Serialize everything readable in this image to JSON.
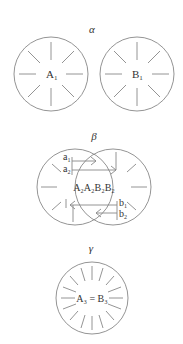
{
  "panels": {
    "alpha": {
      "title": "α",
      "left_label": "A",
      "left_sub": "1",
      "right_label": "B",
      "right_sub": "1"
    },
    "beta": {
      "title": "β",
      "center_text": "A₂A₂B₂B₂",
      "arrows_left": [
        {
          "label": "a",
          "sub": "1"
        },
        {
          "label": "a",
          "sub": "2"
        }
      ],
      "arrows_right": [
        {
          "label": "b",
          "sub": "1"
        },
        {
          "label": "b",
          "sub": "2"
        }
      ]
    },
    "gamma": {
      "title": "γ",
      "center_text": "A₃ = B₃"
    }
  },
  "colors": {
    "stroke": "#888888",
    "text": "#333333"
  }
}
